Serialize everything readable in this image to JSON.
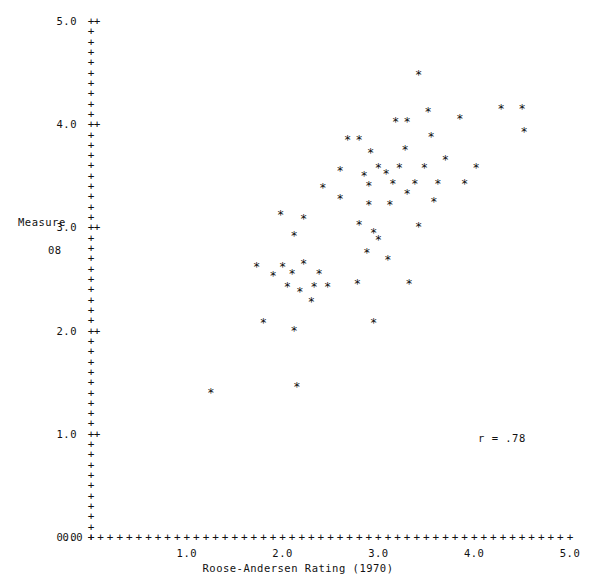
{
  "chart_data": {
    "type": "scatter",
    "title": "",
    "xlabel": "Roose-Andersen Rating (1970)",
    "ylabel": "Measure",
    "ylabel_line2": "08",
    "xlim": [
      0.0,
      5.0
    ],
    "ylim": [
      0.0,
      5.0
    ],
    "xticks": [
      0.0,
      1.0,
      2.0,
      3.0,
      4.0,
      5.0
    ],
    "yticks": [
      0.0,
      1.0,
      2.0,
      3.0,
      4.0,
      5.0
    ],
    "xtick_labels": [
      "0.0",
      "1.0",
      "2.0",
      "3.0",
      "4.0",
      "5.0"
    ],
    "ytick_labels": [
      "0.0",
      "1.0",
      "2.0",
      "3.0",
      "4.0",
      "5.0"
    ],
    "minor_tick_glyph": "+",
    "point_glyph": "*",
    "grid": false,
    "legend": null,
    "annotations": [
      {
        "text": "r = .78",
        "x": 4.05,
        "y": 1.15
      }
    ],
    "correlation": 0.78,
    "n_points": 60,
    "points": [
      {
        "x": 1.25,
        "y": 1.4
      },
      {
        "x": 2.15,
        "y": 1.45
      },
      {
        "x": 1.8,
        "y": 2.07
      },
      {
        "x": 2.12,
        "y": 2.0
      },
      {
        "x": 2.95,
        "y": 2.07
      },
      {
        "x": 2.3,
        "y": 2.28
      },
      {
        "x": 2.18,
        "y": 2.37
      },
      {
        "x": 2.05,
        "y": 2.42
      },
      {
        "x": 2.33,
        "y": 2.42
      },
      {
        "x": 2.47,
        "y": 2.42
      },
      {
        "x": 2.78,
        "y": 2.45
      },
      {
        "x": 3.32,
        "y": 2.45
      },
      {
        "x": 1.9,
        "y": 2.53
      },
      {
        "x": 2.1,
        "y": 2.55
      },
      {
        "x": 2.38,
        "y": 2.55
      },
      {
        "x": 1.73,
        "y": 2.62
      },
      {
        "x": 2.0,
        "y": 2.62
      },
      {
        "x": 2.22,
        "y": 2.65
      },
      {
        "x": 3.1,
        "y": 2.68
      },
      {
        "x": 2.88,
        "y": 2.75
      },
      {
        "x": 3.0,
        "y": 2.88
      },
      {
        "x": 2.12,
        "y": 2.92
      },
      {
        "x": 2.95,
        "y": 2.95
      },
      {
        "x": 2.8,
        "y": 3.02
      },
      {
        "x": 3.42,
        "y": 3.0
      },
      {
        "x": 2.22,
        "y": 3.08
      },
      {
        "x": 1.98,
        "y": 3.12
      },
      {
        "x": 2.9,
        "y": 3.22
      },
      {
        "x": 3.12,
        "y": 3.22
      },
      {
        "x": 3.58,
        "y": 3.25
      },
      {
        "x": 2.6,
        "y": 3.28
      },
      {
        "x": 3.3,
        "y": 3.32
      },
      {
        "x": 2.42,
        "y": 3.38
      },
      {
        "x": 2.9,
        "y": 3.4
      },
      {
        "x": 3.15,
        "y": 3.42
      },
      {
        "x": 3.38,
        "y": 3.42
      },
      {
        "x": 3.62,
        "y": 3.42
      },
      {
        "x": 3.9,
        "y": 3.42
      },
      {
        "x": 2.85,
        "y": 3.5
      },
      {
        "x": 3.08,
        "y": 3.52
      },
      {
        "x": 2.6,
        "y": 3.55
      },
      {
        "x": 3.0,
        "y": 3.58
      },
      {
        "x": 3.22,
        "y": 3.58
      },
      {
        "x": 3.48,
        "y": 3.58
      },
      {
        "x": 4.02,
        "y": 3.58
      },
      {
        "x": 3.7,
        "y": 3.65
      },
      {
        "x": 2.92,
        "y": 3.72
      },
      {
        "x": 3.28,
        "y": 3.75
      },
      {
        "x": 2.68,
        "y": 3.85
      },
      {
        "x": 2.8,
        "y": 3.85
      },
      {
        "x": 3.55,
        "y": 3.88
      },
      {
        "x": 4.52,
        "y": 3.92
      },
      {
        "x": 3.18,
        "y": 4.02
      },
      {
        "x": 3.3,
        "y": 4.02
      },
      {
        "x": 3.85,
        "y": 4.05
      },
      {
        "x": 3.52,
        "y": 4.12
      },
      {
        "x": 4.28,
        "y": 4.15
      },
      {
        "x": 4.5,
        "y": 4.15
      },
      {
        "x": 3.42,
        "y": 4.48
      }
    ]
  },
  "axes": {
    "y_label_text": "Measure",
    "y_label_sub": "08",
    "x_label_text": "Roose-Andersen Rating (1970)",
    "major_tick_glyph": "+",
    "axis_glyph": "+"
  },
  "annotation": {
    "correlation_text": "r = .78"
  }
}
